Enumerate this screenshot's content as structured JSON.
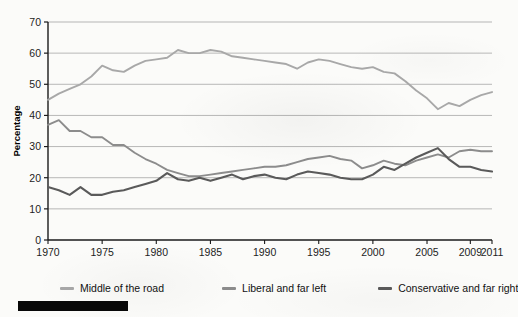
{
  "chart_data": {
    "type": "line",
    "title": "",
    "xlabel": "Year",
    "ylabel": "Percentage",
    "ylim": [
      0,
      70
    ],
    "ytick_values": [
      0,
      10,
      20,
      30,
      40,
      50,
      60,
      70
    ],
    "ytick_labels": [
      "0",
      "10",
      "20",
      "30",
      "40",
      "50",
      "60",
      "70"
    ],
    "xtick_labels": [
      "1970",
      "1975",
      "1980",
      "1985",
      "1990",
      "1995",
      "2000",
      "2005",
      "2009",
      "2011"
    ],
    "xtick_values": [
      1970,
      1975,
      1980,
      1985,
      1990,
      1995,
      2000,
      2005,
      2009,
      2011
    ],
    "xlim": [
      1970,
      2011
    ],
    "grid": "horizontal",
    "legend_position": "bottom",
    "x": [
      1970,
      1971,
      1972,
      1973,
      1974,
      1975,
      1976,
      1977,
      1978,
      1979,
      1980,
      1981,
      1982,
      1983,
      1984,
      1985,
      1986,
      1987,
      1988,
      1989,
      1990,
      1991,
      1992,
      1993,
      1994,
      1995,
      1996,
      1997,
      1998,
      1999,
      2000,
      2001,
      2002,
      2003,
      2004,
      2005,
      2006,
      2007,
      2008,
      2009,
      2010,
      2011
    ],
    "series": [
      {
        "name": "Middle of the road",
        "color": "#a8a8a8",
        "values": [
          45.0,
          47.0,
          48.5,
          50.0,
          52.5,
          56.0,
          54.5,
          54.0,
          56.0,
          57.5,
          58.0,
          58.5,
          61.0,
          60.0,
          60.0,
          61.0,
          60.5,
          59.0,
          58.5,
          58.0,
          57.5,
          57.0,
          56.5,
          55.0,
          57.0,
          58.0,
          57.5,
          56.5,
          55.5,
          55.0,
          55.5,
          54.0,
          53.5,
          51.0,
          48.0,
          45.5,
          42.0,
          44.0,
          43.0,
          45.0,
          46.5,
          47.5
        ]
      },
      {
        "name": "Liberal and far left",
        "color": "#8c8c8c",
        "values": [
          37.0,
          38.5,
          35.0,
          35.0,
          33.0,
          33.0,
          30.5,
          30.5,
          28.0,
          26.0,
          24.5,
          22.5,
          21.5,
          20.5,
          20.5,
          21.0,
          21.5,
          22.0,
          22.5,
          23.0,
          23.5,
          23.5,
          24.0,
          25.0,
          26.0,
          26.5,
          27.0,
          26.0,
          25.5,
          23.0,
          24.0,
          25.5,
          24.5,
          24.0,
          25.5,
          26.5,
          27.5,
          26.5,
          28.5,
          29.0,
          28.5,
          28.5
        ]
      },
      {
        "name": "Conservative and far right",
        "color": "#5a5a5a",
        "values": [
          17.0,
          16.0,
          14.5,
          17.0,
          14.5,
          14.5,
          15.5,
          16.0,
          17.0,
          18.0,
          19.0,
          21.5,
          19.5,
          19.0,
          20.0,
          19.0,
          20.0,
          21.0,
          19.5,
          20.5,
          21.0,
          20.0,
          19.5,
          21.0,
          22.0,
          21.5,
          21.0,
          20.0,
          19.5,
          19.5,
          21.0,
          23.5,
          22.5,
          24.5,
          26.5,
          28.0,
          29.5,
          26.0,
          23.5,
          23.5,
          22.5,
          22.0
        ]
      }
    ]
  },
  "legend": {
    "items": [
      {
        "label": "Middle of the road"
      },
      {
        "label": "Liberal and far left"
      },
      {
        "label": "Conservative and far right"
      }
    ]
  }
}
